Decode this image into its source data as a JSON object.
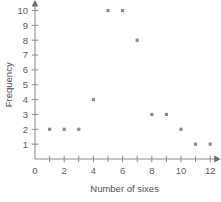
{
  "chart_data": {
    "type": "scatter",
    "title": "",
    "xlabel": "Number of sixes",
    "ylabel": "Frequency",
    "xlim": [
      0,
      12
    ],
    "ylim": [
      0,
      10
    ],
    "grid": false,
    "legend": null,
    "x": [
      1,
      2,
      3,
      4,
      5,
      6,
      7,
      8,
      9,
      10,
      11,
      12
    ],
    "values": [
      2,
      2,
      2,
      4,
      10,
      10,
      8,
      3,
      3,
      2,
      1,
      1
    ],
    "points": [
      {
        "x": 1,
        "y": 2
      },
      {
        "x": 2,
        "y": 2
      },
      {
        "x": 3,
        "y": 2
      },
      {
        "x": 4,
        "y": 4
      },
      {
        "x": 5,
        "y": 10
      },
      {
        "x": 6,
        "y": 10
      },
      {
        "x": 7,
        "y": 8
      },
      {
        "x": 8,
        "y": 3
      },
      {
        "x": 9,
        "y": 3
      },
      {
        "x": 10,
        "y": 2
      },
      {
        "x": 11,
        "y": 1
      },
      {
        "x": 12,
        "y": 1
      }
    ],
    "x_tick_values": [
      0,
      1,
      2,
      3,
      4,
      5,
      6,
      7,
      8,
      9,
      10,
      11,
      12
    ],
    "x_tick_labels": [
      "0",
      "",
      "2",
      "",
      "4",
      "",
      "6",
      "",
      "8",
      "",
      "10",
      "",
      "12"
    ],
    "y_tick_values": [
      1,
      2,
      3,
      4,
      5,
      6,
      7,
      8,
      9,
      10
    ],
    "y_tick_labels": [
      "1",
      "2",
      "3",
      "4",
      "5",
      "6",
      "7",
      "8",
      "9",
      "10"
    ],
    "y_origin_label": "0",
    "marker": "square-dot",
    "marker_color": "#8c8c8c",
    "axis_color": "#8e8e8e",
    "background_color": "#ffffff"
  }
}
